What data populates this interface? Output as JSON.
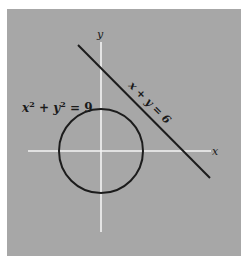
{
  "figure": {
    "background_color": "#a7a7a7",
    "axis_color": "#f4f4f4",
    "curve_color": "#1c1c1c",
    "axes": {
      "x_label": "x",
      "y_label": "y"
    },
    "circle": {
      "equation": "x² + y² = 9",
      "label_parts": {
        "x": "x",
        "sup1": "2",
        "plus": " + ",
        "y": "y",
        "sup2": "2",
        "eq": " = 9"
      },
      "radius": 3,
      "center": [
        0,
        0
      ]
    },
    "line": {
      "equation": "x + y = 6"
    }
  }
}
